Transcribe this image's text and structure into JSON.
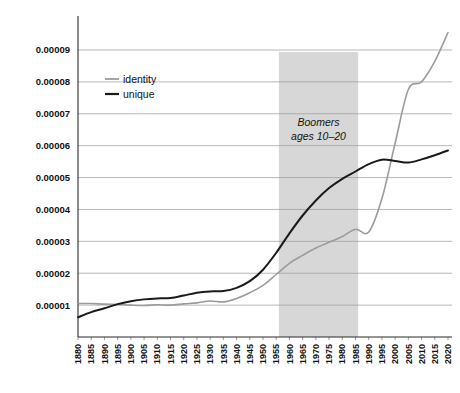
{
  "chart_data": {
    "type": "line",
    "title": "",
    "subtitle": "",
    "xlabel": "",
    "ylabel": "",
    "grid": true,
    "legend_position": "top-left-inside",
    "xlim": [
      1880,
      2020
    ],
    "ylim": [
      0,
      0.0001
    ],
    "ytick_labels": [
      "0.00001",
      "0.00002",
      "0.00003",
      "0.00004",
      "0.00005",
      "0.00006",
      "0.00007",
      "0.00008",
      "0.00009"
    ],
    "ytick_values": [
      1e-05,
      2e-05,
      3e-05,
      4e-05,
      5e-05,
      6e-05,
      7e-05,
      8e-05,
      9e-05
    ],
    "xtick_labels": [
      "1880",
      "1885",
      "1890",
      "1895",
      "1900",
      "1905",
      "1910",
      "1915",
      "1920",
      "1925",
      "1930",
      "1935",
      "1940",
      "1945",
      "1950",
      "1955",
      "1960",
      "1965",
      "1970",
      "1975",
      "1980",
      "1985",
      "1990",
      "1995",
      "2000",
      "2005",
      "2010",
      "2015",
      "2020"
    ],
    "x": [
      1880,
      1885,
      1890,
      1895,
      1900,
      1905,
      1910,
      1915,
      1920,
      1925,
      1930,
      1935,
      1940,
      1945,
      1950,
      1955,
      1960,
      1965,
      1970,
      1975,
      1980,
      1985,
      1990,
      1995,
      2000,
      2005,
      2010,
      2015,
      2020
    ],
    "series": [
      {
        "name": "identity",
        "color": "#9b9b9b",
        "values": [
          1.05e-05,
          1.05e-05,
          1.03e-05,
          1.02e-05,
          1e-05,
          9.9e-06,
          1.01e-05,
          1e-05,
          1.04e-05,
          1.07e-05,
          1.13e-05,
          1.1e-05,
          1.21e-05,
          1.39e-05,
          1.62e-05,
          1.96e-05,
          2.31e-05,
          2.56e-05,
          2.79e-05,
          2.97e-05,
          3.15e-05,
          3.38e-05,
          3.29e-05,
          4.34e-05,
          6.08e-05,
          7.76e-05,
          8e-05,
          8.64e-05,
          9.55e-05
        ]
      },
      {
        "name": "unique",
        "color": "#1a1a1a",
        "values": [
          6.2e-06,
          7.8e-06,
          9e-06,
          1.03e-05,
          1.12e-05,
          1.18e-05,
          1.21e-05,
          1.22e-05,
          1.3e-05,
          1.39e-05,
          1.43e-05,
          1.44e-05,
          1.54e-05,
          1.75e-05,
          2.11e-05,
          2.64e-05,
          3.25e-05,
          3.81e-05,
          4.28e-05,
          4.67e-05,
          4.96e-05,
          5.19e-05,
          5.42e-05,
          5.56e-05,
          5.52e-05,
          5.47e-05,
          5.57e-05,
          5.7e-05,
          5.85e-05
        ]
      }
    ],
    "annotations": [
      {
        "name": "boomers-band",
        "type": "vertical-band",
        "x_start": 1956,
        "x_end": 1986,
        "color": "#c9c9c9",
        "label_line1": "Boomers",
        "label_line2": "ages 10–20"
      }
    ]
  },
  "legend": {
    "items": [
      {
        "label": "identity",
        "color": "#9b9b9b"
      },
      {
        "label": "unique",
        "color": "#1a1a1a"
      }
    ]
  },
  "annotation": {
    "line1": "Boomers",
    "line2": "ages 10–20"
  }
}
